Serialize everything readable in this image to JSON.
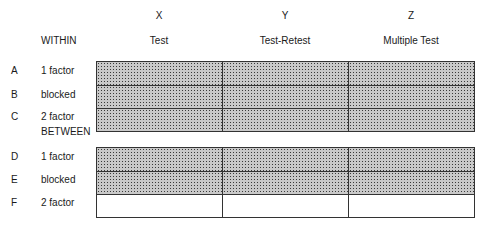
{
  "columns": [
    {
      "letter": "X",
      "name": "Test"
    },
    {
      "letter": "Y",
      "name": "Test-Retest"
    },
    {
      "letter": "Z",
      "name": "Multiple Test"
    }
  ],
  "sections": {
    "within": {
      "heading": "WITHIN",
      "rows": [
        {
          "letter": "A",
          "label": "1 factor",
          "cells": [
            "shaded",
            "shaded",
            "shaded"
          ]
        },
        {
          "letter": "B",
          "label": "blocked",
          "cells": [
            "shaded",
            "shaded",
            "shaded"
          ]
        },
        {
          "letter": "C",
          "label": "2 factor",
          "cells": [
            "shaded",
            "shaded",
            "shaded"
          ]
        }
      ]
    },
    "between": {
      "heading": "BETWEEN",
      "rows": [
        {
          "letter": "D",
          "label": "1 factor",
          "cells": [
            "shaded",
            "shaded",
            "shaded"
          ]
        },
        {
          "letter": "E",
          "label": "blocked",
          "cells": [
            "shaded",
            "shaded",
            "shaded"
          ]
        },
        {
          "letter": "F",
          "label": "2 factor",
          "cells": [
            "empty",
            "empty",
            "empty"
          ]
        }
      ]
    }
  },
  "colors": {
    "shade": "#c9c9c9",
    "line": "#333333"
  }
}
